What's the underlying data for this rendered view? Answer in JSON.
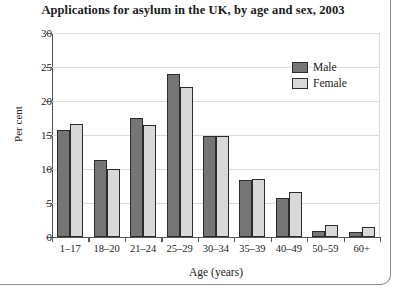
{
  "chart_data": {
    "type": "bar",
    "title": "Applications for asylum in the UK, by age and sex, 2003",
    "xlabel": "Age (years)",
    "ylabel": "Per cent",
    "ylim": [
      0,
      30
    ],
    "yticks": [
      0,
      5,
      10,
      15,
      20,
      25,
      30
    ],
    "grid": true,
    "legend_position": "top-right",
    "categories": [
      "1–17",
      "18–20",
      "21–24",
      "25–29",
      "30–34",
      "35–39",
      "40–49",
      "50–59",
      "60+"
    ],
    "series": [
      {
        "name": "Male",
        "color": "#757575",
        "values": [
          15.8,
          11.3,
          17.5,
          24.0,
          14.8,
          8.4,
          5.8,
          0.9,
          0.8
        ]
      },
      {
        "name": "Female",
        "color": "#d8d8d8",
        "values": [
          16.6,
          10.0,
          16.5,
          22.0,
          14.8,
          8.6,
          6.6,
          1.7,
          1.5
        ]
      }
    ]
  },
  "figure": {
    "axis_color": "#555555",
    "grid_color": "#dcdcdc",
    "bar_outline": "#2b2b2b"
  }
}
